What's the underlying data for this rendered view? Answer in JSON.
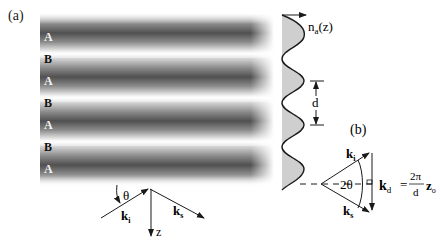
{
  "figure": {
    "panel_a_label": "(a)",
    "panel_b_label": "(b)",
    "layers": [
      {
        "label": "A",
        "type": "A",
        "y": 37
      },
      {
        "label": "B",
        "type": "B",
        "y": 59
      },
      {
        "label": "A",
        "type": "A",
        "y": 81
      },
      {
        "label": "B",
        "type": "B",
        "y": 103
      },
      {
        "label": "A",
        "type": "A",
        "y": 125
      },
      {
        "label": "B",
        "type": "B",
        "y": 147
      },
      {
        "label": "A",
        "type": "A",
        "y": 169
      }
    ],
    "profile": {
      "label_n": "n",
      "label_sub": "a",
      "label_arg": "(z)",
      "period_label": "d"
    },
    "scattering": {
      "angle_label": "θ",
      "incident_label": "k",
      "incident_sub": "i",
      "scattered_label": "k",
      "scattered_sub": "s",
      "axis_label": "z"
    },
    "vector_diagram": {
      "angle_label": "2θ",
      "ki_label": "k",
      "ki_sub": "i",
      "ks_label": "k",
      "ks_sub": "s",
      "kd_label": "k",
      "kd_sub": "d",
      "equals": "=",
      "numerator": "2π",
      "denominator": "d",
      "z_unit": "z",
      "z_unit_sub": "o"
    },
    "colors": {
      "ink": "#1a1a1a",
      "profile_fill": "#cfcfcf",
      "band_dark": "#505050",
      "band_light": "#ffffff"
    }
  }
}
